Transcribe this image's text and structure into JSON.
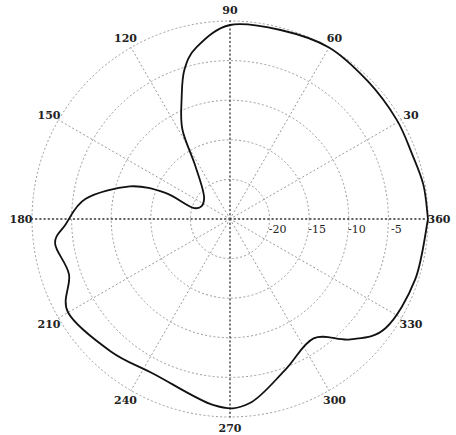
{
  "chart_data": {
    "type": "polar-line",
    "title": "",
    "angle_unit": "degrees",
    "angular_ticks": [
      30,
      60,
      90,
      120,
      150,
      180,
      210,
      240,
      270,
      300,
      330,
      360
    ],
    "radial_ticks": [
      -20,
      -15,
      -10,
      -5
    ],
    "radial_range": [
      -25,
      0
    ],
    "radial_unit": "dB",
    "grid": true,
    "series": [
      {
        "name": "pattern",
        "angle_deg": [
          0,
          10,
          20,
          31,
          45,
          60,
          75,
          90,
          101,
          107,
          112,
          118,
          123,
          141,
          163,
          158,
          162,
          172,
          182,
          188,
          199,
          210,
          228,
          244,
          265,
          276,
          290,
          305,
          315,
          325,
          342,
          360
        ],
        "r_db": [
          0,
          -0.2,
          -0.6,
          -0.5,
          -0.4,
          0,
          -0.3,
          -0.5,
          -2.9,
          -5.3,
          -8.7,
          -12.2,
          -16.9,
          -20.8,
          -20.3,
          -16.2,
          -11.7,
          -6.6,
          -4.2,
          -2.7,
          -3.5,
          -1.4,
          -2.5,
          -3.2,
          -1.4,
          -1.6,
          -4.7,
          -6.6,
          -3.5,
          -1.0,
          -0.4,
          0
        ]
      }
    ]
  }
}
